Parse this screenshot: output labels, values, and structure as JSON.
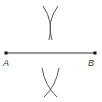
{
  "diagram": {
    "title": "",
    "type": "perpendicular-bisector-construction",
    "colors": {
      "line": "#333333",
      "arc": "#555555",
      "point": "#111111",
      "label": "#333333"
    },
    "segment": {
      "from": "A",
      "to": "B"
    },
    "points": [
      {
        "id": "A",
        "label": "A",
        "x": 6,
        "y": 53
      },
      {
        "id": "B",
        "label": "B",
        "x": 95,
        "y": 53
      }
    ],
    "arc_intersections": [
      {
        "position": "above",
        "x": 50,
        "y": 20
      },
      {
        "position": "below",
        "x": 50,
        "y": 89
      }
    ]
  }
}
